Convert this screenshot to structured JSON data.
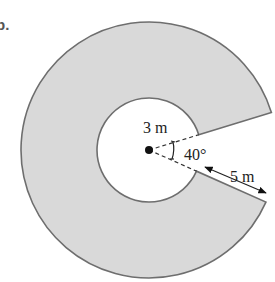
{
  "figure": {
    "part_label": "b.",
    "center": {
      "x": 149,
      "y": 150
    },
    "inner_radius_px": 52,
    "outer_radius_px": 128,
    "gap_start_deg": 17,
    "gap_end_deg": -24,
    "colors": {
      "fill": "#d9d9d9",
      "stroke": "#6e6e6e",
      "dash": "#333333",
      "text": "#222222",
      "background": "#ffffff"
    }
  },
  "labels": {
    "inner_radius": "3 m",
    "angle": "40°",
    "width": "5 m"
  }
}
